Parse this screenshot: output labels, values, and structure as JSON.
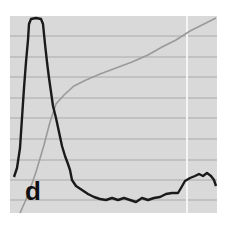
{
  "panel": {
    "label": "d",
    "background": "#d9d9d9",
    "grid_color": "#a9a9a9",
    "highlight_line_color": "#f5f5f5"
  },
  "chart_data": {
    "type": "line",
    "title": "",
    "xlabel": "",
    "ylabel": "",
    "grid": true,
    "legend": "none",
    "annotations": [
      "d"
    ],
    "plot_box_px": {
      "x0": 10,
      "y0": 16,
      "x1": 217,
      "y1": 213
    },
    "horizontal_gridlines_px_y": [
      36,
      57,
      77,
      98,
      118,
      139,
      160,
      180,
      200
    ],
    "vertical_marker_px_x": 187,
    "series": [
      {
        "name": "dark trace",
        "color": "#1a1a1a",
        "points_px": [
          [
            14,
            177
          ],
          [
            17,
            168
          ],
          [
            20,
            148
          ],
          [
            22,
            118
          ],
          [
            24,
            88
          ],
          [
            26,
            62
          ],
          [
            28,
            40
          ],
          [
            29,
            24
          ],
          [
            31,
            19
          ],
          [
            36,
            18
          ],
          [
            41,
            19
          ],
          [
            43,
            24
          ],
          [
            45,
            44
          ],
          [
            47,
            62
          ],
          [
            49,
            78
          ],
          [
            51,
            92
          ],
          [
            53,
            106
          ],
          [
            56,
            118
          ],
          [
            59,
            132
          ],
          [
            62,
            146
          ],
          [
            65,
            156
          ],
          [
            68,
            164
          ],
          [
            70,
            170
          ],
          [
            72,
            180
          ],
          [
            76,
            186
          ],
          [
            82,
            190
          ],
          [
            88,
            194
          ],
          [
            94,
            197
          ],
          [
            100,
            199
          ],
          [
            106,
            200
          ],
          [
            112,
            198
          ],
          [
            118,
            200
          ],
          [
            124,
            198
          ],
          [
            130,
            200
          ],
          [
            136,
            202
          ],
          [
            142,
            198
          ],
          [
            148,
            200
          ],
          [
            154,
            198
          ],
          [
            160,
            197
          ],
          [
            166,
            194
          ],
          [
            172,
            193
          ],
          [
            178,
            193
          ],
          [
            181,
            188
          ],
          [
            185,
            181
          ],
          [
            190,
            178
          ],
          [
            195,
            176
          ],
          [
            199,
            174
          ],
          [
            203,
            176
          ],
          [
            207,
            173
          ],
          [
            211,
            176
          ],
          [
            214,
            180
          ],
          [
            216,
            186
          ]
        ]
      },
      {
        "name": "light trace",
        "color": "#9a9a9a",
        "points_px": [
          [
            20,
            213
          ],
          [
            28,
            195
          ],
          [
            36,
            172
          ],
          [
            44,
            145
          ],
          [
            50,
            122
          ],
          [
            56,
            104
          ],
          [
            64,
            95
          ],
          [
            74,
            86
          ],
          [
            86,
            80
          ],
          [
            100,
            74
          ],
          [
            116,
            68
          ],
          [
            132,
            62
          ],
          [
            148,
            55
          ],
          [
            162,
            47
          ],
          [
            176,
            40
          ],
          [
            190,
            31
          ],
          [
            204,
            24
          ],
          [
            216,
            18
          ]
        ]
      }
    ]
  }
}
